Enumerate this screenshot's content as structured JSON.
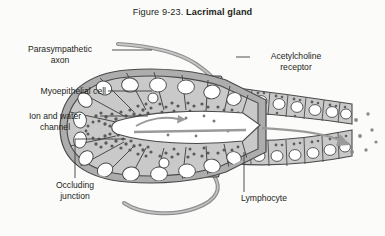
{
  "figure": {
    "number": "Figure 9-23.",
    "name": "Lacrimal gland",
    "background_color": "#fbfbfa",
    "text_color": "#231f20"
  },
  "labels": {
    "parasympathetic_axon": "Parasympathetic\naxon",
    "parasympathetic_axon_line1": "Parasympathetic",
    "parasympathetic_axon_line2": "axon",
    "myoepithelial_cell": "Myoepithelial cell",
    "ion_and_water_channel_line1": "Ion and water",
    "ion_and_water_channel_line2": "channel",
    "occluding_junction_line1": "Occluding",
    "occluding_junction_line2": "junction",
    "acetylcholine_receptor_line1": "Acetylcholine",
    "acetylcholine_receptor_line2": "receptor",
    "lymphocyte": "Lymphocyte"
  },
  "diagram": {
    "type": "anatomical-illustration",
    "structures": [
      "parasympathetic axon",
      "acetylcholine receptor",
      "myoepithelial cell",
      "ion and water channel",
      "occluding junction",
      "lymphocyte",
      "acinar secretory cells",
      "acinar lumen",
      "duct columnar cells",
      "secretory granules",
      "secretion flow arrow",
      "secreted droplets"
    ],
    "colors": {
      "cell_cytoplasm": "#c9c9c9",
      "cell_outline": "#555555",
      "nucleus_fill": "#ffffff",
      "granule": "#606060",
      "myoepithelium": "#a8a8a8",
      "axon": "#8a8a8a",
      "lumen": "#ffffff",
      "arrow": "#999999",
      "leader_line": "#3d3d3d"
    },
    "flow_direction": "left acinus to right duct opening"
  }
}
